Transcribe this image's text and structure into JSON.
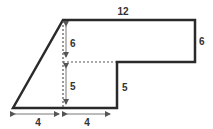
{
  "diagram": {
    "colors": {
      "outline": "#2a2a2a",
      "dashed": "#555555",
      "arrow": "#555555",
      "label": "#333333"
    },
    "labels": {
      "top_width": "12",
      "right_height": "6",
      "inner_upper_height": "6",
      "inner_lower_height": "5",
      "step_height": "5",
      "bottom_left_width": "4",
      "bottom_right_width": "4"
    }
  }
}
